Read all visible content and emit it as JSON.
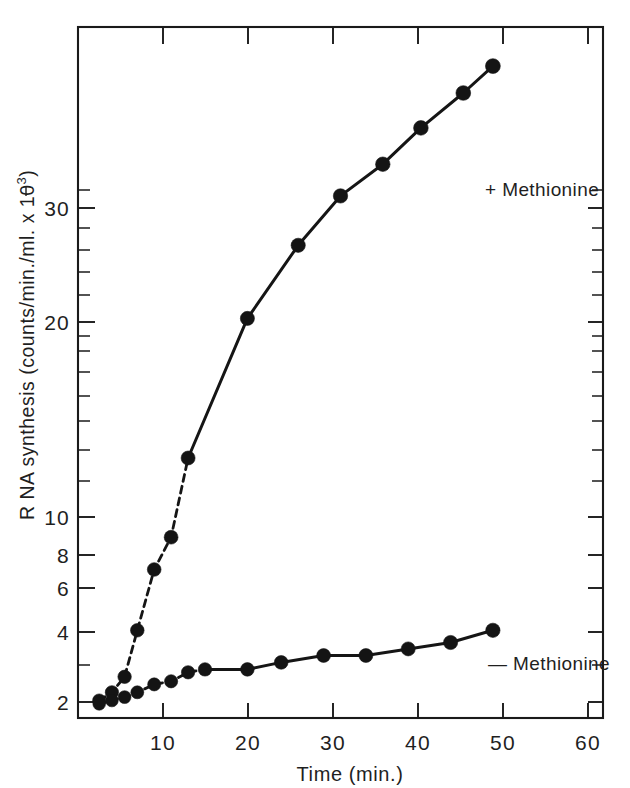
{
  "figure": {
    "background_color": "#ffffff",
    "ink_color": "#151515"
  },
  "axes": {
    "x": {
      "title": "Time (min.)",
      "tick_labels": [
        "10",
        "20",
        "30",
        "40",
        "50",
        "60"
      ],
      "tick_values": [
        10,
        20,
        30,
        40,
        50,
        60
      ],
      "range": [
        0,
        62
      ],
      "scale": "linear"
    },
    "y": {
      "title_parts": {
        "main": "R NA  synthesis (counts/min./ml. x 10",
        "exponent": "3",
        "close": ")"
      },
      "title_plain": "R NA synthesis (counts/min./ml. x 10⁻³)",
      "tick_labels": [
        "2",
        "4",
        "6",
        "8",
        "10",
        "20",
        "30"
      ],
      "tick_values": [
        2,
        4,
        6,
        8,
        10,
        20,
        30
      ],
      "minor_tick_values": [
        1.2,
        3,
        5,
        7,
        9,
        12,
        14,
        16,
        18,
        22,
        24,
        26,
        28,
        32
      ],
      "range": [
        1.1,
        34
      ],
      "scale": "log"
    }
  },
  "series_labels": {
    "plus": "+ Methionine",
    "minus": "— Methionine"
  },
  "chart_data": {
    "type": "line",
    "title": "",
    "xlabel": "Time (min.)",
    "ylabel": "R NA synthesis (counts/min./ml. x 10⁻³)",
    "xlim": [
      0,
      62
    ],
    "ylim": [
      1.1,
      34
    ],
    "yscale": "log",
    "xscale": "linear",
    "grid": false,
    "legend_position": "inline-annotation",
    "series": [
      {
        "name": "+ Methionine",
        "marker": "filled-circle",
        "line_style": "dashed-then-solid",
        "x": [
          2.5,
          4,
          5.5,
          7,
          9,
          11,
          13,
          20,
          26,
          31,
          36,
          40.5,
          45.5,
          49
        ],
        "y": [
          1.2,
          1.25,
          1.35,
          1.7,
          2.3,
          2.7,
          4.0,
          8.0,
          11.5,
          14.7,
          17.2,
          20.6,
          24.5,
          28.0
        ]
      },
      {
        "name": "— Methionine",
        "marker": "filled-circle",
        "line_style": "dashed-then-solid",
        "x": [
          2.5,
          4,
          5.5,
          7,
          9,
          11,
          13,
          15,
          20,
          24,
          29,
          34,
          39,
          44,
          49
        ],
        "y": [
          1.18,
          1.2,
          1.22,
          1.25,
          1.3,
          1.32,
          1.38,
          1.4,
          1.4,
          1.45,
          1.5,
          1.5,
          1.55,
          1.6,
          1.7
        ]
      }
    ]
  }
}
